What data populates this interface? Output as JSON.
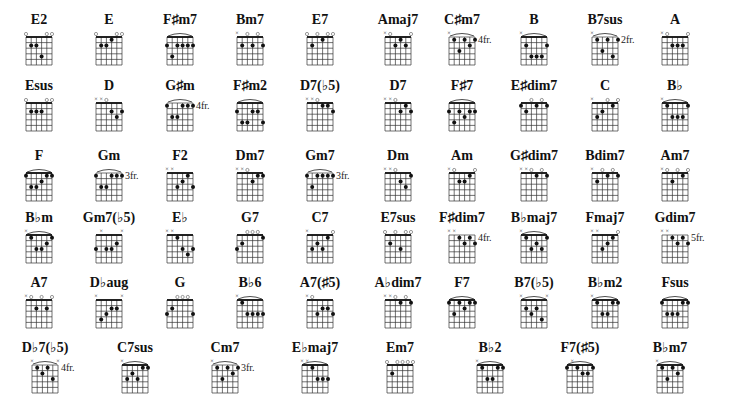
{
  "chart_data": {
    "type": "table",
    "notation": "strings listed low E to high E; x = muted, o = open, number = fret relative to diagram top (1 = first fret row)",
    "chords": [
      {
        "name": "E2",
        "strings": [
          "o",
          2,
          2,
          4,
          "o",
          "o"
        ],
        "fret_label": ""
      },
      {
        "name": "E",
        "strings": [
          "o",
          2,
          2,
          1,
          "o",
          "o"
        ],
        "fret_label": ""
      },
      {
        "name": "F♯m7",
        "strings": [
          2,
          4,
          2,
          2,
          2,
          2
        ],
        "barre": true,
        "fret_label": ""
      },
      {
        "name": "Bm7",
        "strings": [
          "x",
          2,
          "o",
          2,
          "o",
          2
        ],
        "fret_label": ""
      },
      {
        "name": "E7",
        "strings": [
          "o",
          2,
          "o",
          1,
          "o",
          "o"
        ],
        "fret_label": ""
      },
      {
        "name": "Amaj7",
        "strings": [
          "x",
          "o",
          2,
          1,
          2,
          "o"
        ],
        "fret_label": ""
      },
      {
        "name": "C♯m7",
        "strings": [
          "x",
          1,
          3,
          1,
          2,
          1
        ],
        "barre": true,
        "fret_label": "4fr."
      },
      {
        "name": "B",
        "strings": [
          "x",
          2,
          4,
          4,
          4,
          2
        ],
        "barre": true,
        "fret_label": ""
      },
      {
        "name": "B7sus",
        "strings": [
          "x",
          1,
          3,
          1,
          4,
          1
        ],
        "barre": true,
        "fret_label": "2fr."
      },
      {
        "name": "A",
        "strings": [
          "x",
          "o",
          2,
          2,
          2,
          "o"
        ],
        "fret_label": ""
      },
      {
        "name": "Esus",
        "strings": [
          "o",
          2,
          2,
          2,
          "o",
          "o"
        ],
        "fret_label": ""
      },
      {
        "name": "D",
        "strings": [
          "x",
          "x",
          "o",
          2,
          3,
          2
        ],
        "fret_label": ""
      },
      {
        "name": "G♯m",
        "strings": [
          1,
          3,
          3,
          1,
          1,
          1
        ],
        "barre": true,
        "fret_label": "4fr."
      },
      {
        "name": "F♯m2",
        "strings": [
          2,
          4,
          4,
          2,
          2,
          4
        ],
        "barre": true,
        "fret_label": ""
      },
      {
        "name": "D7(♭5)",
        "strings": [
          "x",
          "x",
          "o",
          1,
          1,
          2
        ],
        "fret_label": ""
      },
      {
        "name": "D7",
        "strings": [
          "x",
          "x",
          "o",
          2,
          1,
          2
        ],
        "fret_label": ""
      },
      {
        "name": "F♯7",
        "strings": [
          2,
          4,
          2,
          3,
          2,
          2
        ],
        "barre": true,
        "fret_label": ""
      },
      {
        "name": "E♯dim7",
        "strings": [
          1,
          2,
          "o",
          1,
          "o",
          1
        ],
        "fret_label": ""
      },
      {
        "name": "C",
        "strings": [
          "x",
          3,
          2,
          "o",
          1,
          "o"
        ],
        "fret_label": ""
      },
      {
        "name": "B♭",
        "strings": [
          "x",
          1,
          3,
          3,
          3,
          1
        ],
        "barre": true,
        "fret_label": ""
      },
      {
        "name": "F",
        "strings": [
          1,
          3,
          3,
          2,
          1,
          1
        ],
        "barre": true,
        "fret_label": ""
      },
      {
        "name": "Gm",
        "strings": [
          1,
          3,
          3,
          1,
          1,
          1
        ],
        "barre": true,
        "fret_label": "3fr."
      },
      {
        "name": "F2",
        "strings": [
          "x",
          "x",
          3,
          2,
          1,
          3
        ],
        "fret_label": ""
      },
      {
        "name": "Dm7",
        "strings": [
          "x",
          "x",
          "o",
          2,
          1,
          1
        ],
        "fret_label": ""
      },
      {
        "name": "Gm7",
        "strings": [
          1,
          3,
          1,
          1,
          1,
          1
        ],
        "barre": true,
        "fret_label": "3fr."
      },
      {
        "name": "Dm",
        "strings": [
          "x",
          "x",
          "o",
          2,
          3,
          1
        ],
        "fret_label": ""
      },
      {
        "name": "Am",
        "strings": [
          "x",
          "o",
          2,
          2,
          1,
          "o"
        ],
        "fret_label": ""
      },
      {
        "name": "G♯dim7",
        "strings": [
          "x",
          "x",
          "o",
          1,
          "o",
          1
        ],
        "fret_label": ""
      },
      {
        "name": "Bdim7",
        "strings": [
          "x",
          2,
          "o",
          1,
          "o",
          1
        ],
        "fret_label": ""
      },
      {
        "name": "Am7",
        "strings": [
          "x",
          "o",
          2,
          "o",
          1,
          "o"
        ],
        "fret_label": ""
      },
      {
        "name": "B♭m",
        "strings": [
          "x",
          1,
          3,
          3,
          2,
          1
        ],
        "barre": true,
        "fret_label": ""
      },
      {
        "name": "Gm7(♭5)",
        "strings": [
          3,
          "x",
          3,
          3,
          2,
          "x"
        ],
        "fret_label": ""
      },
      {
        "name": "E♭",
        "strings": [
          "x",
          "x",
          1,
          3,
          4,
          3
        ],
        "fret_label": ""
      },
      {
        "name": "G7",
        "strings": [
          3,
          2,
          "o",
          "o",
          "o",
          1
        ],
        "fret_label": ""
      },
      {
        "name": "C7",
        "strings": [
          "x",
          3,
          2,
          3,
          1,
          "o"
        ],
        "fret_label": ""
      },
      {
        "name": "E7sus",
        "strings": [
          "o",
          2,
          "o",
          3,
          "o",
          "o"
        ],
        "fret_label": ""
      },
      {
        "name": "F♯dim7",
        "strings": [
          "x",
          "x",
          1,
          2,
          1,
          2
        ],
        "fret_label": "4fr."
      },
      {
        "name": "B♭maj7",
        "strings": [
          "x",
          1,
          3,
          2,
          3,
          1
        ],
        "barre": true,
        "fret_label": ""
      },
      {
        "name": "Fmaj7",
        "strings": [
          "x",
          "x",
          3,
          2,
          1,
          "o"
        ],
        "fret_label": ""
      },
      {
        "name": "Gdim7",
        "strings": [
          "x",
          "x",
          1,
          2,
          1,
          2
        ],
        "fret_label": "5fr."
      },
      {
        "name": "A7",
        "strings": [
          "x",
          "o",
          2,
          "o",
          2,
          "o"
        ],
        "fret_label": ""
      },
      {
        "name": "D♭aug",
        "strings": [
          "x",
          4,
          3,
          2,
          2,
          "x"
        ],
        "fret_label": ""
      },
      {
        "name": "G",
        "strings": [
          3,
          2,
          "o",
          "o",
          "o",
          3
        ],
        "fret_label": ""
      },
      {
        "name": "B♭6",
        "strings": [
          "x",
          1,
          3,
          3,
          3,
          3
        ],
        "barre": true,
        "fret_label": ""
      },
      {
        "name": "A7(♯5)",
        "strings": [
          "x",
          "o",
          3,
          2,
          2,
          3
        ],
        "fret_label": ""
      },
      {
        "name": "A♭dim7",
        "strings": [
          "x",
          "x",
          "o",
          1,
          "o",
          1
        ],
        "fret_label": ""
      },
      {
        "name": "F7",
        "strings": [
          1,
          3,
          1,
          2,
          1,
          1
        ],
        "barre": true,
        "fret_label": ""
      },
      {
        "name": "B7(♭5)",
        "strings": [
          "x",
          2,
          3,
          2,
          4,
          "x"
        ],
        "barre": true,
        "fret_label": ""
      },
      {
        "name": "B♭m2",
        "strings": [
          "x",
          1,
          3,
          3,
          1,
          1
        ],
        "barre": true,
        "fret_label": ""
      },
      {
        "name": "Fsus",
        "strings": [
          1,
          3,
          3,
          3,
          1,
          1
        ],
        "barre": true,
        "fret_label": ""
      },
      {
        "name": "D♭7(♭5)",
        "strings": [
          "x",
          1,
          2,
          1,
          3,
          "x"
        ],
        "barre": true,
        "fret_label": "4fr."
      },
      {
        "name": "C7sus",
        "strings": [
          "x",
          3,
          2,
          3,
          1,
          1
        ],
        "barre": true,
        "fret_label": ""
      },
      {
        "name": "Cm7",
        "strings": [
          "x",
          1,
          3,
          1,
          2,
          1
        ],
        "barre": true,
        "fret_label": "3fr."
      },
      {
        "name": "E♭maj7",
        "strings": [
          "x",
          "x",
          1,
          3,
          3,
          3
        ],
        "barre": true,
        "fret_label": ""
      },
      {
        "name": "Em7",
        "strings": [
          "o",
          2,
          "o",
          "o",
          "o",
          "o"
        ],
        "fret_label": ""
      },
      {
        "name": "B♭2",
        "strings": [
          "x",
          1,
          3,
          3,
          1,
          1
        ],
        "barre": true,
        "fret_label": ""
      },
      {
        "name": "F7(♯5)",
        "strings": [
          1,
          "x",
          1,
          2,
          2,
          1
        ],
        "barre": true,
        "fret_label": ""
      },
      {
        "name": "B♭m7",
        "strings": [
          "x",
          1,
          3,
          1,
          2,
          1
        ],
        "barre": true,
        "fret_label": ""
      }
    ]
  }
}
